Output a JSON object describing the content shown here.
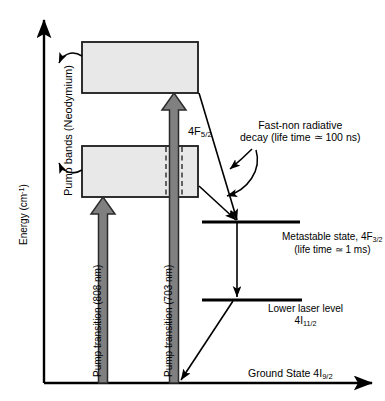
{
  "figure": {
    "kind": "energy-level-diagram"
  },
  "axes": {
    "y_label_text": "Energy (cm",
    "y_label_sup": "-1",
    "y_label_tail": ")",
    "ground_state_prefix": "Ground State 4I",
    "ground_state_sub": "9/2"
  },
  "bands": {
    "group_label": "Pump bands (Neodymium)",
    "upper_band_name": "upper-pump-band",
    "lower_band_name": "lower-pump-band",
    "fill_color": "#e8e8e8",
    "stroke_color": "#1a1a1a"
  },
  "transitions": {
    "pump_808_label": "Pump transition (808 nm)",
    "pump_703_label": "Pump transition (703 nm)",
    "arrow_fill": "#808080",
    "arrow_stroke": "#2b2b2b"
  },
  "annotations": {
    "f52_prefix": "4F",
    "f52_sub": "5/2",
    "decay_line1": "Fast-non radiative",
    "decay_line2": "decay (life time ≃ 100 ns)",
    "metastable_line1_prefix": "Metastable state, 4F",
    "metastable_line1_sub": "3/2",
    "metastable_line2": "(life time ≃ 1 ms)",
    "lower_level_line1": "Lower laser level",
    "lower_level_line2_prefix": "4I",
    "lower_level_line2_sub": "11/2"
  },
  "levels": {
    "metastable_name": "metastable-level-line",
    "lower_laser_name": "lower-laser-level-line",
    "line_color": "#000000"
  }
}
